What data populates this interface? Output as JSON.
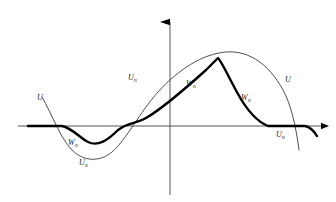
{
  "figure": {
    "background_color": "#ffffff",
    "ink_color": "#000000",
    "thin_curve_color": "#3c3c3c",
    "bold_curve_color": "#000000",
    "axis_color": "#555555",
    "width": 336,
    "height": 202
  },
  "axes": {
    "horizontal": {
      "name": "x-axis",
      "y": 126,
      "x_start": 18,
      "x_end": 328,
      "arrow": "right-arrowhead"
    },
    "vertical": {
      "name": "y-axis",
      "x": 170,
      "y_start": 195,
      "y_end": 14,
      "arrow": "up-arrowhead"
    }
  },
  "labels": [
    {
      "id": "label-u-left",
      "base": "U",
      "sub": "",
      "x": 37,
      "y": 94,
      "curve": "U"
    },
    {
      "id": "label-wn-lower-left",
      "base": "W",
      "sub": "n",
      "x": 68,
      "y": 139,
      "curve": "Wn"
    },
    {
      "id": "label-un-bottom",
      "base": "U",
      "sub": "n",
      "x": 79,
      "y": 159,
      "curve": "Un"
    },
    {
      "id": "label-un-upper-mid",
      "base": "U",
      "sub": "n",
      "x": 128,
      "y": 74,
      "curve": "Un"
    },
    {
      "id": "label-wn-upper-mid",
      "base": "W",
      "sub": "n",
      "x": 186,
      "y": 80,
      "curve": "Wn"
    },
    {
      "id": "label-wn-right",
      "base": "W",
      "sub": "n",
      "x": 241,
      "y": 94,
      "curve": "Wn"
    },
    {
      "id": "label-u-right",
      "base": "U",
      "sub": "",
      "x": 285,
      "y": 76,
      "curve": "U"
    },
    {
      "id": "label-un-bottom-right",
      "base": "U",
      "sub": "n",
      "x": 276,
      "y": 131,
      "curve": "Un"
    }
  ],
  "chart_data": {
    "type": "line",
    "title": "",
    "xlabel": "",
    "ylabel": "",
    "grid": false,
    "legend": "inline-curve-labels",
    "axis_origin": {
      "x": 170,
      "y": 126
    },
    "series": [
      {
        "name": "U",
        "style": "thin",
        "stroke_width": 0.9,
        "color": "#3c3c3c",
        "description": "Smooth sinusoid: starts upper-left above axis, dips to a trough, rises through the origin region, attains a broad maximum right of the y-axis, then descends below the axis at the far right.",
        "path": "M 42 97 C 52 114, 60 138, 72 150 C 84 162, 100 162, 112 152 C 126 140, 140 112, 158 92 C 178 70, 202 54, 226 52 C 250 50, 272 66, 286 96 C 293 112, 297 134, 299 150"
      },
      {
        "name": "Wn",
        "style": "bold",
        "stroke_width": 2.4,
        "color": "#000000",
        "description": "Piecewise approximation: flat on the axis at the left, dips into a shallow rounded trough, rises steeply and nearly linearly through the axis to a sharp peak, descends steeply back to the axis, runs flat along the axis, then drops slightly at the far right.",
        "path": "M 28 126 L 62 126 C 72 128, 80 138, 88 142 C 98 147, 108 140, 118 130 C 128 122, 136 124, 146 118 C 160 110, 186 88, 206 70 C 212 64, 216 60, 218 58 C 222 62, 228 76, 238 94 C 248 112, 258 122, 268 126 L 305 126 C 310 127, 314 131, 317 136"
      }
    ]
  }
}
